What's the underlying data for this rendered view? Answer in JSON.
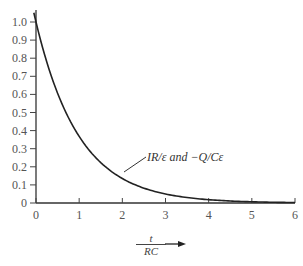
{
  "chart_data": {
    "type": "line",
    "title": "",
    "xlabel": "t / RC",
    "xlabel_numerator": "t",
    "xlabel_denominator": "RC",
    "ylabel": "",
    "xlim": [
      0,
      6
    ],
    "ylim": [
      0,
      1.05
    ],
    "x_ticks": [
      "0",
      "1",
      "2",
      "3",
      "4",
      "5",
      "6"
    ],
    "y_ticks": [
      "0",
      "0.1",
      "0.2",
      "0.3",
      "0.4",
      "0.5",
      "0.6",
      "0.7",
      "0.8",
      "0.9",
      "1.0"
    ],
    "grid": false,
    "series": [
      {
        "name": "IR/ε and −Q/Cε",
        "function": "exp(-x)",
        "x": [
          0,
          0.5,
          1,
          1.5,
          2,
          2.5,
          3,
          3.5,
          4,
          4.5,
          5,
          5.5,
          6
        ],
        "values": [
          1.0,
          0.61,
          0.37,
          0.22,
          0.14,
          0.08,
          0.05,
          0.03,
          0.02,
          0.01,
          0.01,
          0.0,
          0.0
        ]
      }
    ],
    "annotations": [
      {
        "text": "IR/ε and −Q/Cε",
        "points_to_x": 1.1,
        "points_to_y": 0.33
      }
    ]
  },
  "labels": {
    "curve": "IR/ε and −Q/Cε",
    "x_num": "t",
    "x_den": "RC",
    "arrow": "➞"
  }
}
